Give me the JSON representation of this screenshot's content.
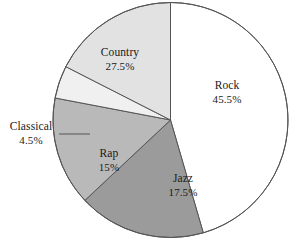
{
  "chart_data": {
    "type": "pie",
    "title": "",
    "categories": [
      "Rock",
      "Jazz",
      "Rap",
      "Classical",
      "Country"
    ],
    "values": [
      45.5,
      17.5,
      15,
      4.5,
      27.5
    ],
    "unit": "%",
    "start_angle_deg": 0,
    "direction": "clockwise",
    "legend": "none",
    "labels_inside": true,
    "slices": [
      {
        "name": "Rock",
        "value": 45.5,
        "value_label": "45.5%",
        "color": "#ffffff",
        "start_deg": 0,
        "end_deg": 163.8
      },
      {
        "name": "Jazz",
        "value": 17.5,
        "value_label": "17.5%",
        "color": "#9b9b9b",
        "start_deg": 163.8,
        "end_deg": 226.8
      },
      {
        "name": "Rap",
        "value": 15,
        "value_label": "15%",
        "color": "#b9b9b9",
        "start_deg": 226.8,
        "end_deg": 280.8
      },
      {
        "name": "Classical",
        "value": 4.5,
        "value_label": "4.5%",
        "color": "#f0f0f0",
        "start_deg": 280.8,
        "end_deg": 297.0
      },
      {
        "name": "Country",
        "value": 27.5,
        "value_label": "27.5%",
        "color": "#e2e2e2",
        "start_deg": 297.0,
        "end_deg": 360
      }
    ],
    "geometry": {
      "center_x": 170.5,
      "center_y": 120,
      "radius": 117.5,
      "stroke": "#555555",
      "stroke_width": 1
    },
    "leader_line": {
      "for": "Classical",
      "x1": 59,
      "y1": 134,
      "x2": 90,
      "y2": 134
    }
  }
}
